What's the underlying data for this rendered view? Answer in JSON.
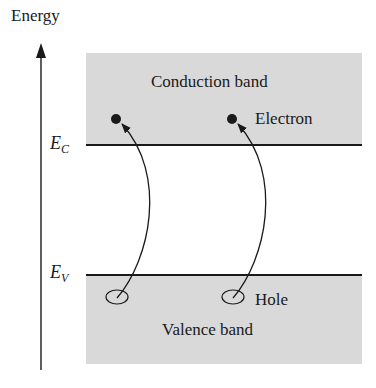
{
  "diagram": {
    "axis": {
      "label": "Energy",
      "direction": "up"
    },
    "levels": {
      "conduction_edge": {
        "symbol": "E",
        "subscript": "C"
      },
      "valence_edge": {
        "symbol": "E",
        "subscript": "V"
      }
    },
    "bands": {
      "conduction": {
        "label": "Conduction band",
        "fill": "#d9d9d9"
      },
      "valence": {
        "label": "Valence band",
        "fill": "#d9d9d9"
      }
    },
    "particles": {
      "electron_label": "Electron",
      "hole_label": "Hole",
      "count": 2
    },
    "transitions": [
      {
        "from": "hole-1",
        "to": "electron-1"
      },
      {
        "from": "hole-2",
        "to": "electron-2"
      }
    ],
    "colors": {
      "line": "#1a1a1a",
      "band_fill": "#d9d9d9",
      "background": "#ffffff"
    }
  }
}
